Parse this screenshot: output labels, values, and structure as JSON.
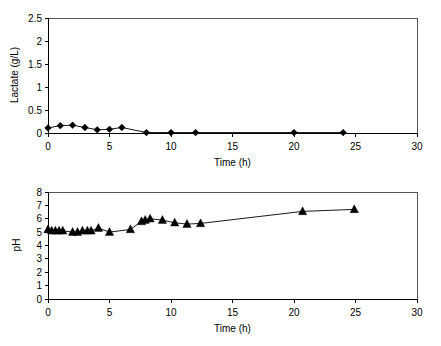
{
  "figure": {
    "background": "#ffffff",
    "foreground": "#000000",
    "panel_count": 2
  },
  "chart_data": [
    {
      "id": "lactate",
      "type": "line",
      "title": "",
      "xlabel": "Time (h)",
      "ylabel": "Lactate (g/L)",
      "xlim": [
        0,
        30
      ],
      "ylim": [
        0,
        2.5
      ],
      "xticks": [
        0,
        5,
        10,
        15,
        20,
        25,
        30
      ],
      "xtick_labels": [
        "0",
        "5",
        "10",
        "15",
        "20",
        "25",
        "30"
      ],
      "yticks": [
        0,
        0.5,
        1,
        1.5,
        2,
        2.5
      ],
      "ytick_labels": [
        "0",
        "0.5",
        "1",
        "1.5",
        "2",
        "2.5"
      ],
      "grid": false,
      "legend": "none",
      "marker": "diamond",
      "marker_color": "#000000",
      "line_color": "#000000",
      "series": [
        {
          "name": "Lactate",
          "x": [
            0.0,
            1.0,
            2.0,
            3.0,
            4.0,
            5.0,
            6.0,
            8.0,
            10.0,
            12.0,
            20.0,
            24.0
          ],
          "y": [
            0.11,
            0.16,
            0.17,
            0.12,
            0.07,
            0.08,
            0.12,
            0.01,
            0.01,
            0.01,
            0.01,
            0.01
          ]
        }
      ]
    },
    {
      "id": "ph",
      "type": "line",
      "title": "",
      "xlabel": "Time (h)",
      "ylabel": "pH",
      "xlim": [
        0,
        30
      ],
      "ylim": [
        0,
        8
      ],
      "xticks": [
        0,
        5,
        10,
        15,
        20,
        25,
        30
      ],
      "xtick_labels": [
        "0",
        "5",
        "10",
        "15",
        "20",
        "25",
        "30"
      ],
      "yticks": [
        0,
        1,
        2,
        3,
        4,
        5,
        6,
        7,
        8
      ],
      "ytick_labels": [
        "0",
        "1",
        "2",
        "3",
        "4",
        "5",
        "6",
        "7",
        "8"
      ],
      "grid": false,
      "legend": "none",
      "marker": "triangle",
      "marker_color": "#000000",
      "line_color": "#000000",
      "series": [
        {
          "name": "pH",
          "x": [
            0.0,
            0.3,
            0.6,
            0.9,
            1.2,
            2.0,
            2.4,
            2.8,
            3.2,
            3.5,
            4.1,
            5.0,
            6.7,
            7.6,
            7.9,
            8.3,
            9.3,
            10.3,
            11.3,
            12.4,
            20.7,
            24.9
          ],
          "y": [
            5.2,
            5.1,
            5.1,
            5.1,
            5.1,
            5.0,
            5.0,
            5.1,
            5.1,
            5.1,
            5.3,
            5.0,
            5.2,
            5.8,
            5.9,
            6.0,
            5.9,
            5.7,
            5.6,
            5.65,
            6.55,
            6.7
          ]
        }
      ]
    }
  ]
}
